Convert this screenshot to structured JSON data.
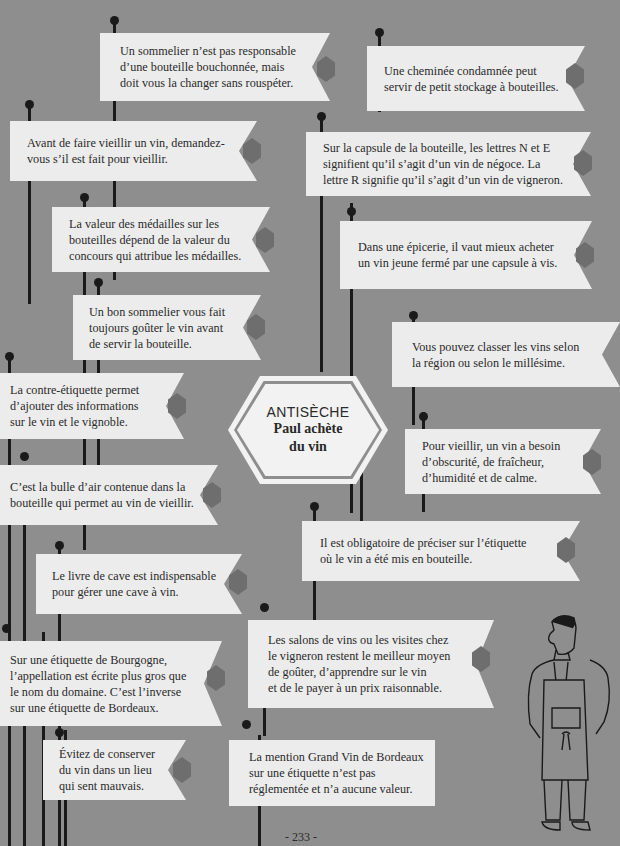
{
  "page": {
    "background": "#8e8e8e",
    "banner_color": "#ececec",
    "diamond_color": "#6e6e6e",
    "line_color": "#1a1a1a",
    "page_number": "- 233 -"
  },
  "center": {
    "kicker": "ANTISÈCHE",
    "title": "Paul achète\ndu vin"
  },
  "tips": [
    {
      "text": "Un sommelier n’est pas responsable\nd’une bouteille bouchonnée, mais\ndoit vous la changer sans rouspéter."
    },
    {
      "text": "Une cheminée condamnée peut\nservir de petit stockage à bouteilles."
    },
    {
      "text": "Avant de faire vieillir un vin, demandez-\nvous s’il est fait pour vieillir."
    },
    {
      "text": "Sur la capsule de la bouteille, les lettres N et E\nsignifient qu’il s’agit d’un vin de négoce. La\nlettre R signifie qu’il s’agit d’un vin de vigneron."
    },
    {
      "text": "La valeur des médailles sur les\nbouteilles dépend de la valeur du\nconcours qui attribue les médailles."
    },
    {
      "text": "Dans une épicerie, il vaut mieux acheter\nun vin jeune fermé par une capsule à vis."
    },
    {
      "text": "Un bon sommelier vous fait\ntoujours goûter le vin avant\nde servir la bouteille."
    },
    {
      "text": "Vous pouvez classer les vins selon\nla région ou selon le millésime."
    },
    {
      "text": "La contre-étiquette permet\nd’ajouter des informations\nsur le vin et le vignoble."
    },
    {
      "text": "Pour vieillir, un vin a besoin\nd’obscurité, de fraîcheur,\nd’humidité et de calme."
    },
    {
      "text": "C’est la bulle d’air contenue dans la\nbouteille qui permet au vin de vieillir."
    },
    {
      "text": "Il est obligatoire de préciser sur l’étiquette\noù le vin a été mis en bouteille."
    },
    {
      "text": "Le livre de cave est indispensable\npour gérer une cave à vin."
    },
    {
      "text": "Les salons de vins ou les visites chez\nle vigneron restent le meilleur moyen\nde goûter, d’apprendre sur le vin\net de le payer à un prix raisonnable."
    },
    {
      "text": "Sur une étiquette de Bourgogne,\nl’appellation est écrite plus gros que\nle nom du domaine. C’est l’inverse\nsur une étiquette de Bordeaux."
    },
    {
      "text": "Évitez de conserver\ndu vin dans un lieu\nqui sent mauvais."
    },
    {
      "text": "La mention Grand Vin de Bordeaux\nsur une étiquette n’est pas\nréglementée et n’a aucune valeur."
    }
  ]
}
